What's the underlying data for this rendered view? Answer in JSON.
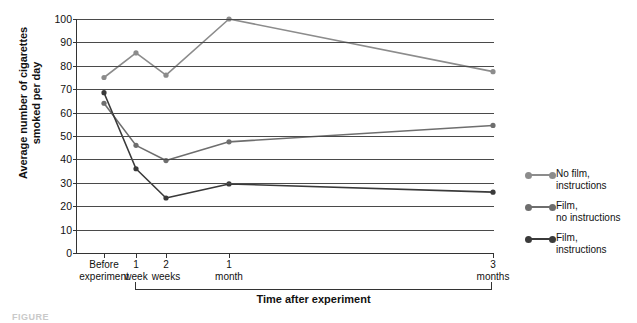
{
  "axes": {
    "y_title_line1": "Average number of cigarettes",
    "y_title_line2": "smoked per day",
    "x_title": "Time after experiment",
    "y_ticks": [
      "100",
      "90",
      "80",
      "70",
      "60",
      "50",
      "40",
      "30",
      "20",
      "10",
      "0"
    ],
    "x_tick_labels": [
      {
        "line1": "Before",
        "line2": "experiment"
      },
      {
        "line1": "1",
        "line2": "week"
      },
      {
        "line1": "2",
        "line2": "weeks"
      },
      {
        "line1": "1",
        "line2": "month"
      },
      {
        "line1": "3",
        "line2": "months"
      }
    ]
  },
  "legend": {
    "position": "right",
    "entries": [
      {
        "line1": "No film,",
        "line2": "instructions",
        "color": "#8c8c8c"
      },
      {
        "line1": "Film,",
        "line2": "no instructions",
        "color": "#6e6e6e"
      },
      {
        "line1": "Film,",
        "line2": "instructions",
        "color": "#3a3a3a"
      }
    ]
  },
  "caption": "FIGURE",
  "chart_data": {
    "type": "line",
    "title": "",
    "xlabel": "Time after experiment",
    "ylabel": "Average number of cigarettes smoked per day",
    "ylim": [
      0,
      100
    ],
    "ytick_step": 10,
    "grid": true,
    "legend_position": "right",
    "categories": [
      "Before experiment",
      "1 week",
      "2 weeks",
      "1 month",
      "3 months"
    ],
    "x_positions": [
      103,
      135,
      165,
      228,
      492
    ],
    "series": [
      {
        "name": "No film, instructions",
        "color": "#8c8c8c",
        "values": [
          75,
          85.5,
          76,
          100,
          77.5
        ]
      },
      {
        "name": "Film, no instructions",
        "color": "#6e6e6e",
        "values": [
          64,
          46,
          39.5,
          47.5,
          54.5
        ]
      },
      {
        "name": "Film, instructions",
        "color": "#3a3a3a",
        "values": [
          68.5,
          36,
          23.5,
          29.5,
          26
        ]
      }
    ]
  }
}
